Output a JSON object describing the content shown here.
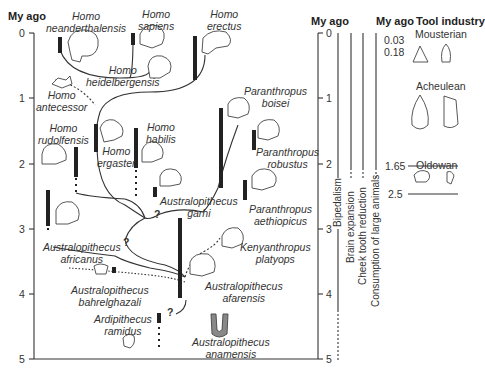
{
  "figure": {
    "left_axis": {
      "title": "My ago",
      "ticks": [
        "0",
        "1",
        "2",
        "3",
        "4",
        "5"
      ]
    },
    "right_axis": {
      "title": "My ago",
      "ticks": [
        "0",
        "1",
        "2",
        "3",
        "4",
        "5"
      ]
    },
    "tool_axis": {
      "title_my": "My ago",
      "title_tool": "Tool industry",
      "ticks": [
        "0.03",
        "0.18",
        "1.65",
        "2.5"
      ]
    },
    "tool_industries": [
      "Mousterian",
      "Acheulean",
      "Oldowan"
    ],
    "traits": [
      "Bipedalism",
      "Brain expansion",
      "Cheek tooth reduction",
      "Consumption of large animals"
    ],
    "species": {
      "neanderthalensis": [
        "Homo",
        "neanderthalensis"
      ],
      "sapiens": [
        "Homo",
        "sapiens"
      ],
      "erectus": [
        "Homo",
        "erectus"
      ],
      "heidelbergensis": [
        "Homo",
        "heidelbergensis"
      ],
      "antecessor": [
        "Homo",
        "antecessor"
      ],
      "rudolfensis": [
        "Homo",
        "rudolfensis"
      ],
      "ergaster": [
        "Homo",
        "ergaster"
      ],
      "habilis": [
        "Homo",
        "habilis"
      ],
      "boisei": [
        "Paranthropus",
        "boisei"
      ],
      "robustus": [
        "Paranthropus",
        "robustus"
      ],
      "garhi": [
        "Australopithecus",
        "garhi"
      ],
      "aethiopicus": [
        "Paranthropus",
        "aethiopicus"
      ],
      "africanus": [
        "Australopithecus",
        "africanus"
      ],
      "kenyanthropus": [
        "Kenyanthropus",
        "platyops"
      ],
      "bahrelghazali": [
        "Australopithecus",
        "bahrelghazali"
      ],
      "afarensis": [
        "Australopithecus",
        "afarensis"
      ],
      "ramidus": [
        "Ardipithecus",
        "ramidus"
      ],
      "anamensis": [
        "Australopithecus",
        "anamensis"
      ]
    },
    "uncertainty_marker": "?"
  }
}
